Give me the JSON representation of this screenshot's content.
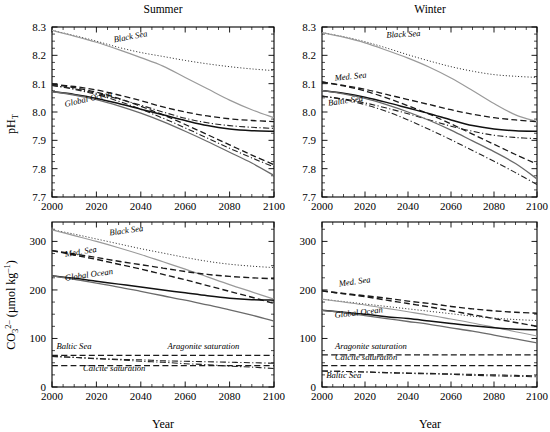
{
  "figure": {
    "title_summer": "Summer",
    "title_winter": "Winter",
    "xlabel": "Year",
    "ylabel_top": "pH",
    "ylabel_top_sub": "T",
    "ylabel_bottom_main": "CO",
    "ylabel_bottom_sub": "3",
    "ylabel_bottom_sup": "2–",
    "ylabel_bottom_units": " (µmol kg",
    "ylabel_bottom_units_sup": "–1",
    "ylabel_bottom_units_close": ")"
  },
  "axes": {
    "x_ticks": [
      "2000",
      "2020",
      "2040",
      "2060",
      "2080",
      "2100"
    ],
    "x_tick_values": [
      2000,
      2020,
      2040,
      2060,
      2080,
      2100
    ],
    "x_range": [
      2000,
      2100
    ],
    "x_minor_step": 5,
    "y_ticks_top": [
      "7.7",
      "7.8",
      "7.9",
      "8.0",
      "8.1",
      "8.2",
      "8.3"
    ],
    "y_tick_values_top": [
      7.7,
      7.8,
      7.9,
      8.0,
      8.1,
      8.2,
      8.3
    ],
    "y_range_top": [
      7.7,
      8.3
    ],
    "y_minor_step_top": 0.025,
    "y_ticks_bottom": [
      "0",
      "100",
      "200",
      "300"
    ],
    "y_tick_values_bottom": [
      0,
      100,
      200,
      300
    ],
    "y_range_bottom": [
      0,
      340
    ],
    "y_minor_step_bottom": 25
  },
  "annotations": {
    "black_sea": "Black Sea",
    "med_sea": "Med. Sea",
    "global_ocean": "Global Ocean",
    "baltic_sea": "Baltic Sea",
    "aragonite": "Aragonite saturation",
    "calcite": "Calcite saturation"
  },
  "chart_data": [
    {
      "id": "summer-ph",
      "type": "line",
      "title": "Summer",
      "xlabel": "Year",
      "ylabel": "pH_T",
      "xlim": [
        2000,
        2100
      ],
      "ylim": [
        7.7,
        8.3
      ],
      "grid": false,
      "legend": "inline-annotations",
      "x": [
        2000,
        2010,
        2020,
        2030,
        2040,
        2050,
        2060,
        2070,
        2080,
        2090,
        2100
      ],
      "series": [
        {
          "name": "Black Sea (dotted)",
          "style": "dotted",
          "color": "#333333",
          "width": 1.0,
          "values": [
            8.288,
            8.27,
            8.25,
            8.228,
            8.21,
            8.196,
            8.182,
            8.17,
            8.16,
            8.152,
            8.146
          ]
        },
        {
          "name": "Black Sea (solid grey)",
          "style": "solid",
          "color": "#9a9a9a",
          "width": 1.2,
          "values": [
            8.288,
            8.268,
            8.246,
            8.22,
            8.192,
            8.162,
            8.122,
            8.082,
            8.042,
            8.008,
            7.98
          ]
        },
        {
          "name": "Med. Sea (dashed)",
          "style": "dashed",
          "color": "#1a1a1a",
          "width": 1.3,
          "values": [
            8.098,
            8.09,
            8.078,
            8.06,
            8.04,
            8.018,
            8.0,
            7.986,
            7.976,
            7.97,
            7.966
          ]
        },
        {
          "name": "Med. Sea (dashed low)",
          "style": "dashed",
          "color": "#1a1a1a",
          "width": 1.3,
          "values": [
            8.098,
            8.086,
            8.07,
            8.048,
            8.02,
            7.99,
            7.956,
            7.92,
            7.884,
            7.848,
            7.814
          ]
        },
        {
          "name": "Baltic Sea (dash-dot)",
          "style": "dashdot",
          "color": "#222222",
          "width": 1.1,
          "values": [
            8.094,
            8.082,
            8.066,
            8.046,
            8.024,
            8.0,
            7.978,
            7.962,
            7.952,
            7.946,
            7.942
          ]
        },
        {
          "name": "Baltic Sea (dash-dot low)",
          "style": "dashdot",
          "color": "#222222",
          "width": 1.1,
          "values": [
            8.094,
            8.08,
            8.062,
            8.038,
            8.01,
            7.978,
            7.944,
            7.908,
            7.872,
            7.838,
            7.806
          ]
        },
        {
          "name": "Global Ocean (solid)",
          "style": "solid",
          "color": "#111111",
          "width": 1.5,
          "values": [
            8.072,
            8.062,
            8.048,
            8.03,
            8.01,
            7.99,
            7.97,
            7.952,
            7.94,
            7.934,
            7.932
          ]
        },
        {
          "name": "Global Ocean (solid low)",
          "style": "solid",
          "color": "#6a6a6a",
          "width": 1.3,
          "values": [
            8.072,
            8.06,
            8.044,
            8.022,
            7.996,
            7.966,
            7.932,
            7.896,
            7.858,
            7.82,
            7.776
          ]
        }
      ]
    },
    {
      "id": "winter-ph",
      "type": "line",
      "title": "Winter",
      "xlabel": "Year",
      "ylabel": "pH_T",
      "xlim": [
        2000,
        2100
      ],
      "ylim": [
        7.7,
        8.3
      ],
      "grid": false,
      "legend": "inline-annotations",
      "x": [
        2000,
        2010,
        2020,
        2030,
        2040,
        2050,
        2060,
        2070,
        2080,
        2090,
        2100
      ],
      "series": [
        {
          "name": "Black Sea (dotted)",
          "style": "dotted",
          "color": "#333333",
          "width": 1.0,
          "values": [
            8.28,
            8.266,
            8.248,
            8.226,
            8.202,
            8.18,
            8.16,
            8.144,
            8.132,
            8.126,
            8.122
          ]
        },
        {
          "name": "Black Sea (solid grey)",
          "style": "solid",
          "color": "#9a9a9a",
          "width": 1.2,
          "values": [
            8.28,
            8.264,
            8.244,
            8.218,
            8.19,
            8.158,
            8.12,
            8.076,
            8.03,
            7.99,
            7.966
          ]
        },
        {
          "name": "Med. Sea (dashed)",
          "style": "dashed",
          "color": "#1a1a1a",
          "width": 1.3,
          "values": [
            8.106,
            8.094,
            8.08,
            8.062,
            8.044,
            8.026,
            8.008,
            7.992,
            7.98,
            7.972,
            7.966
          ]
        },
        {
          "name": "Med. Sea (dashed low)",
          "style": "dashed",
          "color": "#1a1a1a",
          "width": 1.3,
          "values": [
            8.106,
            8.092,
            8.074,
            8.05,
            8.022,
            7.992,
            7.958,
            7.922,
            7.886,
            7.85,
            7.816
          ]
        },
        {
          "name": "Baltic Sea (dash-dot)",
          "style": "dashdot",
          "color": "#222222",
          "width": 1.1,
          "values": [
            8.056,
            8.046,
            8.032,
            8.014,
            7.994,
            7.972,
            7.95,
            7.932,
            7.918,
            7.91,
            7.906
          ]
        },
        {
          "name": "Baltic Sea (dash-dot low)",
          "style": "dashdot",
          "color": "#222222",
          "width": 1.1,
          "values": [
            8.056,
            8.044,
            8.026,
            8.002,
            7.972,
            7.938,
            7.902,
            7.864,
            7.826,
            7.786,
            7.744
          ]
        },
        {
          "name": "Global Ocean (solid)",
          "style": "solid",
          "color": "#111111",
          "width": 1.5,
          "values": [
            8.076,
            8.066,
            8.052,
            8.034,
            8.014,
            7.994,
            7.972,
            7.952,
            7.94,
            7.934,
            7.932
          ]
        },
        {
          "name": "Global Ocean (solid low)",
          "style": "solid",
          "color": "#6a6a6a",
          "width": 1.3,
          "values": [
            8.076,
            8.064,
            8.048,
            8.026,
            8.0,
            7.97,
            7.936,
            7.898,
            7.86,
            7.818,
            7.764
          ]
        }
      ]
    },
    {
      "id": "summer-co3",
      "type": "line",
      "title": "Summer",
      "xlabel": "Year",
      "ylabel": "CO3 2- (umol kg-1)",
      "xlim": [
        2000,
        2100
      ],
      "ylim": [
        0,
        340
      ],
      "grid": false,
      "legend": "inline-annotations",
      "x": [
        2000,
        2010,
        2020,
        2030,
        2040,
        2050,
        2060,
        2070,
        2080,
        2090,
        2100
      ],
      "series": [
        {
          "name": "Black Sea (dotted)",
          "style": "dotted",
          "color": "#333333",
          "width": 1.0,
          "values": [
            324,
            315,
            305,
            295,
            285,
            276,
            267,
            259,
            253,
            249,
            246
          ]
        },
        {
          "name": "Black Sea (solid grey)",
          "style": "solid",
          "color": "#9a9a9a",
          "width": 1.2,
          "values": [
            324,
            312,
            300,
            287,
            273,
            258,
            243,
            227,
            211,
            196,
            181
          ]
        },
        {
          "name": "Med. Sea (dashed)",
          "style": "dashed",
          "color": "#1a1a1a",
          "width": 1.4,
          "values": [
            281,
            274,
            267,
            259,
            252,
            245,
            238,
            232,
            228,
            225,
            223
          ]
        },
        {
          "name": "Med. Sea (dashed low)",
          "style": "dashed",
          "color": "#1a1a1a",
          "width": 1.4,
          "values": [
            281,
            272,
            263,
            253,
            243,
            232,
            221,
            209,
            197,
            185,
            172
          ]
        },
        {
          "name": "Global Ocean (solid)",
          "style": "solid",
          "color": "#111111",
          "width": 1.5,
          "values": [
            229,
            224,
            218,
            212,
            206,
            200,
            194,
            188,
            183,
            180,
            179
          ]
        },
        {
          "name": "Global Ocean (solid low)",
          "style": "solid",
          "color": "#6a6a6a",
          "width": 1.3,
          "values": [
            229,
            222,
            214,
            206,
            197,
            188,
            179,
            169,
            159,
            148,
            136
          ]
        },
        {
          "name": "Aragonite saturation",
          "style": "dashed",
          "color": "#1a1a1a",
          "width": 1.2,
          "values": [
            65,
            65,
            65,
            65,
            65,
            65,
            65,
            65,
            65,
            65,
            65
          ]
        },
        {
          "name": "Calcite saturation",
          "style": "dashed",
          "color": "#1a1a1a",
          "width": 1.2,
          "values": [
            44,
            44,
            44,
            44,
            44,
            44,
            44,
            44,
            44,
            44,
            44
          ]
        },
        {
          "name": "Baltic Sea (dash-dot)",
          "style": "dashdot",
          "color": "#222222",
          "width": 1.1,
          "values": [
            63,
            61,
            59,
            57,
            56,
            54,
            53,
            52,
            51,
            50,
            49
          ]
        },
        {
          "name": "Baltic Sea (dash-dot low)",
          "style": "dashdot",
          "color": "#222222",
          "width": 1.1,
          "values": [
            63,
            61,
            58,
            56,
            53,
            51,
            48,
            46,
            43,
            41,
            38
          ]
        }
      ]
    },
    {
      "id": "winter-co3",
      "type": "line",
      "title": "Winter",
      "xlabel": "Year",
      "ylabel": "CO3 2- (umol kg-1)",
      "xlim": [
        2000,
        2100
      ],
      "ylim": [
        0,
        340
      ],
      "grid": false,
      "legend": "inline-annotations",
      "x": [
        2000,
        2010,
        2020,
        2030,
        2040,
        2050,
        2060,
        2070,
        2080,
        2090,
        2100
      ],
      "series": [
        {
          "name": "Med. Sea (dashed)",
          "style": "dashed",
          "color": "#1a1a1a",
          "width": 1.4,
          "values": [
            198,
            193,
            188,
            183,
            177,
            172,
            166,
            161,
            157,
            154,
            152
          ]
        },
        {
          "name": "Med. Sea (dashed low)",
          "style": "dashed",
          "color": "#1a1a1a",
          "width": 1.4,
          "values": [
            198,
            192,
            186,
            179,
            172,
            165,
            157,
            149,
            141,
            133,
            125
          ]
        },
        {
          "name": "Black Sea (dotted)",
          "style": "dotted",
          "color": "#333333",
          "width": 1.0,
          "values": [
            181,
            176,
            171,
            166,
            161,
            156,
            151,
            146,
            142,
            139,
            137
          ]
        },
        {
          "name": "Black Sea (solid grey)",
          "style": "solid",
          "color": "#9a9a9a",
          "width": 1.1,
          "values": [
            181,
            175,
            169,
            162,
            155,
            148,
            140,
            132,
            123,
            114,
            105
          ]
        },
        {
          "name": "Global Ocean (solid)",
          "style": "solid",
          "color": "#111111",
          "width": 1.5,
          "values": [
            158,
            154,
            150,
            145,
            141,
            136,
            131,
            126,
            122,
            119,
            118
          ]
        },
        {
          "name": "Global Ocean (solid low)",
          "style": "solid",
          "color": "#6a6a6a",
          "width": 1.3,
          "values": [
            158,
            153,
            147,
            141,
            135,
            129,
            122,
            115,
            107,
            99,
            91
          ]
        },
        {
          "name": "Aragonite saturation",
          "style": "dashed",
          "color": "#1a1a1a",
          "width": 1.2,
          "values": [
            66,
            66,
            66,
            66,
            66,
            66,
            66,
            66,
            66,
            66,
            66
          ]
        },
        {
          "name": "Calcite saturation",
          "style": "dashed",
          "color": "#1a1a1a",
          "width": 1.2,
          "values": [
            44,
            44,
            44,
            44,
            44,
            44,
            44,
            44,
            44,
            44,
            44
          ]
        },
        {
          "name": "Baltic Sea (dash-dot)",
          "style": "dashdot",
          "color": "#222222",
          "width": 1.1,
          "values": [
            33,
            32,
            31,
            30,
            29,
            28,
            27,
            26,
            25,
            24,
            23
          ]
        },
        {
          "name": "Baltic Sea (dash-dot low)",
          "style": "dashdot",
          "color": "#222222",
          "width": 1.1,
          "values": [
            33,
            32,
            31,
            29,
            28,
            27,
            26,
            24,
            23,
            22,
            21
          ]
        }
      ]
    }
  ],
  "panel_annotations": {
    "summer-ph": [
      {
        "text": "Black Sea",
        "x": 2028,
        "y": 8.245,
        "rot": -11
      },
      {
        "text": "Global Ocean",
        "x": 2006,
        "y": 8.018,
        "rot": -13
      }
    ],
    "winter-ph": [
      {
        "text": "Black Sea",
        "x": 2030,
        "y": 8.262,
        "rot": -3
      },
      {
        "text": "Med. Sea",
        "x": 2006,
        "y": 8.11,
        "rot": -6
      },
      {
        "text": "Baltic Sea",
        "x": 2003,
        "y": 8.022,
        "rot": -8
      }
    ],
    "summer-co3": [
      {
        "text": "Black Sea",
        "x": 2026,
        "y": 312,
        "rot": -8
      },
      {
        "text": "Med. Sea",
        "x": 2006,
        "y": 268,
        "rot": -9
      },
      {
        "text": "Global Ocean",
        "x": 2006,
        "y": 219,
        "rot": -8
      },
      {
        "text": "Baltic Sea",
        "x": 2002,
        "y": 78,
        "rot": 0
      },
      {
        "text": "Aragonite saturation",
        "x": 2052,
        "y": 78,
        "rot": 0
      },
      {
        "text": "Calcite saturation",
        "x": 2014,
        "y": 33,
        "rot": 0
      }
    ],
    "winter-co3": [
      {
        "text": "Med. Sea",
        "x": 2008,
        "y": 207,
        "rot": -8
      },
      {
        "text": "Global Ocean",
        "x": 2006,
        "y": 142,
        "rot": -7
      },
      {
        "text": "Aragonite saturation",
        "x": 2006,
        "y": 79,
        "rot": 0
      },
      {
        "text": "Calcite saturation",
        "x": 2006,
        "y": 55,
        "rot": 0
      },
      {
        "text": "Baltic Sea",
        "x": 2002,
        "y": 18,
        "rot": 0
      }
    ]
  }
}
